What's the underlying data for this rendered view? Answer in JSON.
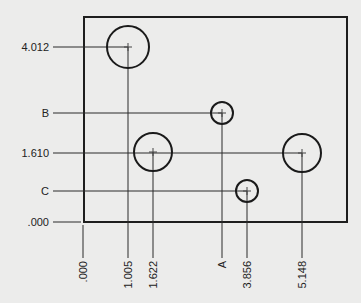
{
  "diagram": {
    "type": "ordinate-dimensioned-plate",
    "colors": {
      "background": "#ececeb",
      "line": "#1e1e1e",
      "text": "#222222"
    },
    "frame": {
      "x1": 84,
      "y1": 17,
      "x2": 347,
      "y2": 222
    },
    "y_dimensions": [
      {
        "label": "4.012",
        "y": 47
      },
      {
        "label": "B",
        "y": 113
      },
      {
        "label": "1.610",
        "y": 153
      },
      {
        "label": "C",
        "y": 191
      },
      {
        "label": ".000",
        "y": 222
      }
    ],
    "x_dimensions": [
      {
        "label": ".000",
        "x": 83
      },
      {
        "label": "1.005",
        "x": 128
      },
      {
        "label": "1.622",
        "x": 153
      },
      {
        "label": "A",
        "x": 222
      },
      {
        "label": "3.856",
        "x": 247
      },
      {
        "label": "5.148",
        "x": 302
      }
    ],
    "holes": [
      {
        "name": "hole-1",
        "x_label": "1.005",
        "y_label": "4.012",
        "cx": 128,
        "cy": 47,
        "r": 21
      },
      {
        "name": "hole-2",
        "x_label": "A",
        "y_label": "B",
        "cx": 222,
        "cy": 113,
        "r": 11
      },
      {
        "name": "hole-3",
        "x_label": "1.622",
        "y_label": "1.610",
        "cx": 153,
        "cy": 152,
        "r": 19
      },
      {
        "name": "hole-4",
        "x_label": "5.148",
        "y_label": "1.610",
        "cx": 302,
        "cy": 153,
        "r": 19
      },
      {
        "name": "hole-5",
        "x_label": "3.856",
        "y_label": "C",
        "cx": 247,
        "cy": 191,
        "r": 11
      }
    ]
  }
}
